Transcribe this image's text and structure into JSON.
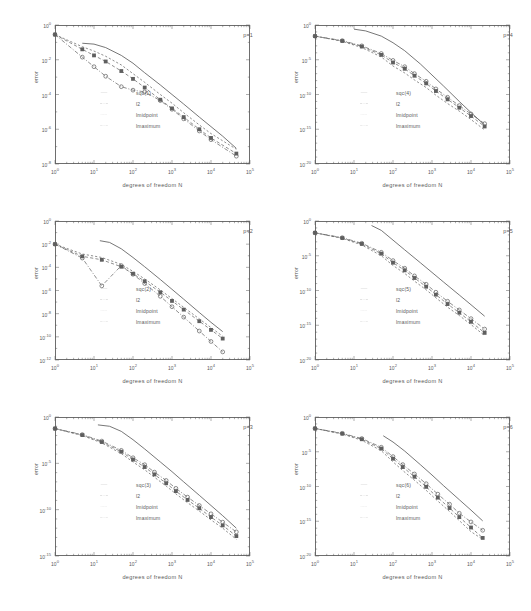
{
  "figure": {
    "type": "multi-panel-convergence-plot",
    "panel_count": 6,
    "layout": "2 columns x 3 rows",
    "axis_scale": "log-log"
  },
  "axes": {
    "xlabel": "degrees of freedom N",
    "ylabel": "error",
    "xticks": [
      "10",
      "10",
      "10",
      "10",
      "10",
      "10"
    ],
    "xtick_exponents": [
      "0",
      "1",
      "2",
      "3",
      "4",
      "5"
    ],
    "xlim_exp": [
      0,
      5
    ]
  },
  "legend_labels": {
    "sqc": "sqc(",
    "l2": "l2",
    "lmidpoint": "lmidpoint",
    "lmaximum": "lmaximum"
  },
  "chart_data": [
    {
      "type": "line",
      "panel": "p=1",
      "title": "p=1",
      "xlabel": "degrees of freedom N",
      "ylabel": "error",
      "xlim_exp": [
        0,
        5
      ],
      "ylim_exp": [
        -8,
        0
      ],
      "ytick_exponents": [
        "0",
        "-2",
        "-4",
        "-6",
        "-8"
      ],
      "legend": [
        "sqc(1)",
        "l2",
        "lmidpoint",
        "lmaximum"
      ],
      "series": [
        {
          "name": "sqc(1)",
          "style": "solid",
          "marker": "none",
          "x_exp": [
            0.7,
            1.0,
            1.3,
            1.7,
            2.0,
            2.3,
            2.7,
            3.0,
            3.3,
            3.7,
            4.0,
            4.3,
            4.65
          ],
          "y_exp": [
            -1.05,
            -1.1,
            -1.3,
            -1.75,
            -2.2,
            -2.75,
            -3.45,
            -4.0,
            -4.55,
            -5.3,
            -5.85,
            -6.4,
            -7.1
          ]
        },
        {
          "name": "l2",
          "style": "dashed",
          "marker": "square",
          "x_exp": [
            0.0,
            0.7,
            1.0,
            1.3,
            1.7,
            2.0,
            2.3,
            2.7,
            3.0,
            3.3,
            3.7,
            4.0,
            4.65
          ],
          "y_exp": [
            -0.55,
            -1.4,
            -1.75,
            -2.1,
            -2.65,
            -3.1,
            -3.6,
            -4.3,
            -4.8,
            -5.3,
            -6.0,
            -6.5,
            -7.4
          ]
        },
        {
          "name": "lmidpoint",
          "style": "dashed-fine",
          "marker": "none",
          "x_exp": [
            0.0,
            0.7,
            1.0,
            1.3,
            1.7,
            2.0,
            2.3,
            2.7,
            3.0,
            3.3,
            3.7,
            4.0,
            4.65
          ],
          "y_exp": [
            -0.55,
            -1.25,
            -1.5,
            -1.8,
            -2.3,
            -2.8,
            -3.3,
            -4.0,
            -4.5,
            -5.05,
            -5.75,
            -6.25,
            -7.15
          ]
        },
        {
          "name": "lmaximum",
          "style": "dash-dot",
          "marker": "circle",
          "x_exp": [
            0.0,
            0.7,
            1.0,
            1.3,
            1.7,
            2.0,
            2.3,
            2.7,
            3.0,
            3.3,
            3.7,
            4.0,
            4.65
          ],
          "y_exp": [
            -0.55,
            -1.85,
            -2.4,
            -2.95,
            -3.55,
            -3.75,
            -3.85,
            -4.35,
            -4.85,
            -5.4,
            -6.1,
            -6.6,
            -7.55
          ]
        }
      ]
    },
    {
      "type": "line",
      "panel": "p=4",
      "title": "p=4",
      "xlabel": "degrees of freedom N",
      "ylabel": "error",
      "xlim_exp": [
        0,
        5
      ],
      "ylim_exp": [
        -20,
        0
      ],
      "ytick_exponents": [
        "0",
        "-5",
        "-10",
        "-15",
        "-20"
      ],
      "legend": [
        "sqc(4)",
        "l2",
        "lmidpoint",
        "lmaximum"
      ],
      "series": [
        {
          "name": "sqc(4)",
          "style": "solid",
          "marker": "none",
          "x_exp": [
            1.0,
            1.3,
            1.7,
            2.0,
            2.3,
            2.7,
            3.0,
            3.3,
            3.7,
            4.0,
            4.35
          ],
          "y_exp": [
            -0.6,
            -0.85,
            -1.6,
            -2.55,
            -3.7,
            -5.6,
            -7.2,
            -8.8,
            -11.0,
            -12.6,
            -14.4
          ]
        },
        {
          "name": "l2",
          "style": "dashed",
          "marker": "square",
          "x_exp": [
            0.0,
            0.7,
            1.2,
            1.7,
            2.0,
            2.3,
            2.55,
            2.85,
            3.1,
            3.4,
            3.7,
            4.0,
            4.35
          ],
          "y_exp": [
            -1.6,
            -2.3,
            -3.1,
            -4.3,
            -5.4,
            -6.3,
            -7.3,
            -8.4,
            -9.5,
            -10.7,
            -11.9,
            -13.1,
            -14.6
          ]
        },
        {
          "name": "lmidpoint",
          "style": "dashed-fine",
          "marker": "none",
          "x_exp": [
            0.0,
            0.7,
            1.2,
            1.7,
            2.0,
            2.3,
            2.55,
            2.85,
            3.1,
            3.4,
            3.7,
            4.0,
            4.35
          ],
          "y_exp": [
            -1.6,
            -2.35,
            -3.25,
            -4.6,
            -5.9,
            -6.9,
            -7.9,
            -9.0,
            -10.1,
            -11.3,
            -12.4,
            -13.6,
            -15.1
          ]
        },
        {
          "name": "lmaximum",
          "style": "dash-dot",
          "marker": "circle",
          "x_exp": [
            0.0,
            0.7,
            1.2,
            1.7,
            2.0,
            2.3,
            2.55,
            2.85,
            3.1,
            3.4,
            3.7,
            4.0,
            4.35
          ],
          "y_exp": [
            -1.6,
            -2.25,
            -3.0,
            -4.1,
            -5.1,
            -6.0,
            -7.0,
            -8.1,
            -9.2,
            -10.4,
            -11.6,
            -12.8,
            -14.2
          ]
        }
      ]
    },
    {
      "type": "line",
      "panel": "p=2",
      "title": "p=2",
      "xlabel": "degrees of freedom N",
      "ylabel": "error",
      "xlim_exp": [
        0,
        5
      ],
      "ylim_exp": [
        -12,
        0
      ],
      "ytick_exponents": [
        "0",
        "-2",
        "-4",
        "-6",
        "-8",
        "-10",
        "-12"
      ],
      "legend": [
        "sqc(2)",
        "l2",
        "lmidpoint",
        "lmaximum"
      ],
      "series": [
        {
          "name": "sqc(2)",
          "style": "solid",
          "marker": "none",
          "x_exp": [
            1.15,
            1.4,
            1.7,
            2.0,
            2.3,
            2.7,
            3.0,
            3.3,
            3.7,
            4.0,
            4.3
          ],
          "y_exp": [
            -1.7,
            -1.85,
            -2.4,
            -3.15,
            -3.95,
            -5.05,
            -5.9,
            -6.75,
            -7.9,
            -8.75,
            -9.55
          ]
        },
        {
          "name": "l2",
          "style": "dashed",
          "marker": "square",
          "x_exp": [
            0.0,
            0.7,
            1.2,
            1.7,
            2.0,
            2.3,
            2.7,
            3.0,
            3.3,
            3.7,
            4.0,
            4.3
          ],
          "y_exp": [
            -2.0,
            -3.05,
            -3.35,
            -3.95,
            -4.55,
            -5.2,
            -6.15,
            -6.9,
            -7.65,
            -8.65,
            -9.4,
            -10.15
          ]
        },
        {
          "name": "lmidpoint",
          "style": "dashed-fine",
          "marker": "none",
          "x_exp": [
            0.0,
            0.7,
            1.2,
            1.7,
            2.0,
            2.3,
            2.7,
            3.0,
            3.3,
            3.7,
            4.0,
            4.3
          ],
          "y_exp": [
            -2.0,
            -2.85,
            -3.15,
            -3.75,
            -4.35,
            -5.0,
            -5.95,
            -6.7,
            -7.45,
            -8.45,
            -9.2,
            -9.95
          ]
        },
        {
          "name": "lmaximum",
          "style": "dash-dot",
          "marker": "circle",
          "x_exp": [
            0.0,
            0.7,
            1.2,
            1.7,
            2.0,
            2.3,
            2.7,
            3.0,
            3.3,
            3.7,
            4.0,
            4.3
          ],
          "y_exp": [
            -2.0,
            -3.2,
            -5.6,
            -3.85,
            -4.6,
            -5.4,
            -6.5,
            -7.4,
            -8.3,
            -9.5,
            -10.4,
            -11.3
          ]
        }
      ]
    },
    {
      "type": "line",
      "panel": "p=5",
      "title": "p=5",
      "xlabel": "degrees of freedom N",
      "ylabel": "error",
      "xlim_exp": [
        0,
        5
      ],
      "ylim_exp": [
        -20,
        0
      ],
      "ytick_exponents": [
        "0",
        "-5",
        "-10",
        "-15",
        "-20"
      ],
      "legend": [
        "sqc(5)",
        "l2",
        "lmidpoint",
        "lmaximum"
      ],
      "series": [
        {
          "name": "sqc(5)",
          "style": "solid",
          "marker": "none",
          "x_exp": [
            1.45,
            1.7,
            2.0,
            2.3,
            2.7,
            3.0,
            3.3,
            3.7,
            4.0,
            4.35
          ],
          "y_exp": [
            -0.65,
            -1.35,
            -2.75,
            -4.15,
            -6.0,
            -7.4,
            -8.8,
            -10.65,
            -12.05,
            -13.7
          ]
        },
        {
          "name": "l2",
          "style": "dashed",
          "marker": "square",
          "x_exp": [
            0.0,
            0.7,
            1.2,
            1.7,
            2.0,
            2.3,
            2.55,
            2.85,
            3.1,
            3.4,
            3.7,
            4.0,
            4.35
          ],
          "y_exp": [
            -1.7,
            -2.45,
            -3.3,
            -4.7,
            -6.0,
            -7.1,
            -8.2,
            -9.45,
            -10.6,
            -11.95,
            -13.2,
            -14.5,
            -16.1
          ]
        },
        {
          "name": "lmidpoint",
          "style": "dashed-fine",
          "marker": "none",
          "x_exp": [
            0.0,
            0.7,
            1.2,
            1.7,
            2.0,
            2.3,
            2.55,
            2.85,
            3.1,
            3.4,
            3.7,
            4.0,
            4.35
          ],
          "y_exp": [
            -1.7,
            -2.5,
            -3.45,
            -5.0,
            -6.4,
            -7.55,
            -8.65,
            -9.9,
            -11.05,
            -12.4,
            -13.6,
            -14.9,
            -16.5
          ]
        },
        {
          "name": "lmaximum",
          "style": "dash-dot",
          "marker": "circle",
          "x_exp": [
            0.0,
            0.7,
            1.2,
            1.7,
            2.0,
            2.3,
            2.55,
            2.85,
            3.1,
            3.4,
            3.7,
            4.0,
            4.35
          ],
          "y_exp": [
            -1.7,
            -2.4,
            -3.2,
            -4.5,
            -5.7,
            -6.8,
            -7.9,
            -9.1,
            -10.25,
            -11.55,
            -12.8,
            -14.05,
            -15.55
          ]
        }
      ]
    },
    {
      "type": "line",
      "panel": "p=3",
      "title": "p=3",
      "xlabel": "degrees of freedom N",
      "ylabel": "error",
      "xlim_exp": [
        0,
        5
      ],
      "ylim_exp": [
        -15,
        0
      ],
      "ytick_exponents": [
        "0",
        "-5",
        "-10",
        "-15"
      ],
      "legend": [
        "sqc(3)",
        "l2",
        "lmidpoint",
        "lmaximum"
      ],
      "series": [
        {
          "name": "sqc(3)",
          "style": "solid",
          "marker": "none",
          "x_exp": [
            1.1,
            1.4,
            1.7,
            2.0,
            2.3,
            2.7,
            3.0,
            3.3,
            3.7,
            4.0,
            4.3,
            4.65
          ],
          "y_exp": [
            -0.85,
            -1.0,
            -1.55,
            -2.45,
            -3.45,
            -4.85,
            -5.9,
            -7.0,
            -8.45,
            -9.55,
            -10.65,
            -12.0
          ]
        },
        {
          "name": "l2",
          "style": "dashed",
          "marker": "square",
          "x_exp": [
            0.0,
            0.7,
            1.2,
            1.7,
            2.0,
            2.3,
            2.55,
            2.85,
            3.1,
            3.4,
            3.7,
            4.0,
            4.3,
            4.65
          ],
          "y_exp": [
            -1.25,
            -1.95,
            -2.7,
            -3.75,
            -4.6,
            -5.4,
            -6.2,
            -7.15,
            -8.0,
            -8.95,
            -9.85,
            -10.8,
            -11.7,
            -12.85
          ]
        },
        {
          "name": "lmidpoint",
          "style": "dashed-fine",
          "marker": "none",
          "x_exp": [
            0.0,
            0.7,
            1.2,
            1.7,
            2.0,
            2.3,
            2.55,
            2.85,
            3.1,
            3.4,
            3.7,
            4.0,
            4.3,
            4.65
          ],
          "y_exp": [
            -1.25,
            -2.0,
            -2.8,
            -3.95,
            -4.85,
            -5.7,
            -6.5,
            -7.45,
            -8.3,
            -9.25,
            -10.15,
            -11.1,
            -12.0,
            -13.2
          ]
        },
        {
          "name": "lmaximum",
          "style": "dash-dot",
          "marker": "circle",
          "x_exp": [
            0.0,
            0.7,
            1.2,
            1.7,
            2.0,
            2.3,
            2.55,
            2.85,
            3.1,
            3.4,
            3.7,
            4.0,
            4.3,
            4.65
          ],
          "y_exp": [
            -1.25,
            -1.9,
            -2.6,
            -3.6,
            -4.4,
            -5.15,
            -5.95,
            -6.85,
            -7.7,
            -8.65,
            -9.55,
            -10.45,
            -11.35,
            -12.4
          ]
        }
      ]
    },
    {
      "type": "line",
      "panel": "p=6",
      "title": "p=6",
      "xlabel": "degrees of freedom N",
      "ylabel": "error",
      "xlim_exp": [
        0,
        5
      ],
      "ylim_exp": [
        -20,
        0
      ],
      "ytick_exponents": [
        "0",
        "-5",
        "-10",
        "-15",
        "-20"
      ],
      "legend": [
        "sqc(6)",
        "l2",
        "lmidpoint",
        "lmaximum"
      ],
      "series": [
        {
          "name": "sqc(6)",
          "style": "solid",
          "marker": "none",
          "x_exp": [
            1.75,
            2.0,
            2.3,
            2.7,
            3.0,
            3.3,
            3.7,
            4.0,
            4.3
          ],
          "y_exp": [
            -2.7,
            -3.6,
            -4.9,
            -6.85,
            -8.35,
            -9.9,
            -11.9,
            -13.4,
            -14.95
          ]
        },
        {
          "name": "l2",
          "style": "dashed",
          "marker": "square",
          "x_exp": [
            0.0,
            0.7,
            1.2,
            1.7,
            2.0,
            2.25,
            2.55,
            2.85,
            3.15,
            3.45,
            3.7,
            4.0,
            4.3
          ],
          "y_exp": [
            -1.65,
            -2.4,
            -3.2,
            -4.55,
            -6.0,
            -7.2,
            -8.6,
            -10.05,
            -11.6,
            -13.1,
            -14.4,
            -15.9,
            -17.4
          ]
        },
        {
          "name": "lmidpoint",
          "style": "dashed-fine",
          "marker": "none",
          "x_exp": [
            0.0,
            0.7,
            1.2,
            1.7,
            2.0,
            2.25,
            2.55,
            2.85,
            3.15,
            3.45,
            3.7,
            4.0,
            4.3
          ],
          "y_exp": [
            -1.65,
            -2.45,
            -3.35,
            -4.85,
            -6.45,
            -7.7,
            -9.1,
            -10.55,
            -12.1,
            -13.6,
            -14.9,
            -16.5,
            -17.6
          ]
        },
        {
          "name": "lmaximum",
          "style": "dash-dot",
          "marker": "circle",
          "x_exp": [
            0.0,
            0.7,
            1.2,
            1.7,
            2.0,
            2.25,
            2.55,
            2.85,
            3.15,
            3.45,
            3.7,
            4.0,
            4.3
          ],
          "y_exp": [
            -1.65,
            -2.35,
            -3.1,
            -4.35,
            -5.7,
            -6.85,
            -8.2,
            -9.6,
            -11.1,
            -12.55,
            -13.85,
            -15.1,
            -16.3
          ]
        }
      ]
    }
  ]
}
